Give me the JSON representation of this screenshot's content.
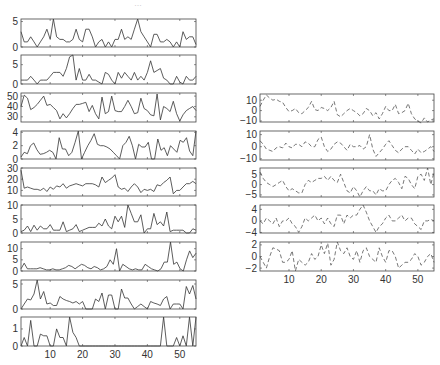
{
  "figure": {
    "top_mark": "…"
  },
  "chart_data": [
    {
      "type": "line",
      "group": "left",
      "panel": 1,
      "box": [
        21,
        19,
        196,
        47
      ],
      "xlim": [
        1,
        55
      ],
      "ylim": [
        0,
        5.5
      ],
      "yticks": [
        0,
        5
      ],
      "xticks": [],
      "grid": false,
      "values": [
        3,
        1,
        1,
        2,
        1,
        0,
        1,
        2,
        3.5,
        1.5,
        5.5,
        2,
        1.5,
        1.5,
        1,
        1,
        1.5,
        3.5,
        1.5,
        1,
        3.5,
        3.5,
        2,
        0,
        1,
        1.5,
        0,
        1,
        0,
        1.5,
        1.5,
        3.5,
        1.5,
        2,
        1.5,
        3.5,
        5.5,
        3,
        2,
        1,
        0,
        2.5,
        2.5,
        1,
        1,
        1.5,
        1,
        0,
        1,
        0,
        3,
        1.5,
        2,
        2,
        0.5
      ]
    },
    {
      "type": "line",
      "group": "left",
      "panel": 2,
      "box": [
        21,
        55,
        196,
        84
      ],
      "xlim": [
        1,
        55
      ],
      "ylim": [
        0,
        7.5
      ],
      "yticks": [
        0,
        5
      ],
      "xticks": [],
      "values": [
        1,
        1,
        1,
        2,
        1,
        0,
        1,
        1,
        1,
        2,
        3,
        3,
        3,
        2,
        4,
        7,
        7.5,
        1,
        4,
        1,
        1,
        2.5,
        1,
        1,
        0.5,
        0,
        3,
        2.5,
        1,
        0,
        3,
        1.5,
        3,
        2,
        1,
        3,
        1,
        2,
        1,
        3,
        6,
        3,
        3.5,
        4,
        1.5,
        1,
        0,
        0,
        2,
        0.5,
        0,
        2,
        1,
        1,
        2
      ]
    },
    {
      "type": "line",
      "group": "left",
      "panel": 3,
      "box": [
        21,
        93,
        196,
        122
      ],
      "xlim": [
        1,
        55
      ],
      "ylim": [
        25,
        53
      ],
      "yticks": [
        30,
        40,
        50
      ],
      "xticks": [],
      "values": [
        40,
        51,
        48,
        37,
        39,
        42,
        46,
        50,
        41,
        42,
        39,
        36,
        28,
        33,
        29,
        33,
        38,
        42,
        42,
        43,
        44,
        35,
        41,
        33,
        28,
        49,
        33,
        35,
        50,
        36,
        35,
        35,
        40,
        46,
        40,
        33,
        34,
        48,
        38,
        36,
        32,
        31,
        52,
        27,
        40,
        38,
        35,
        45,
        33,
        26,
        32,
        36,
        38,
        40,
        36
      ]
    },
    {
      "type": "line",
      "group": "left",
      "panel": 4,
      "box": [
        21,
        131,
        196,
        159
      ],
      "xlim": [
        1,
        55
      ],
      "ylim": [
        0,
        4.2
      ],
      "yticks": [
        0,
        2,
        4
      ],
      "xticks": [],
      "values": [
        0.3,
        1,
        0.8,
        2,
        2.4,
        1.4,
        0.7,
        0.8,
        1,
        1.3,
        1,
        0,
        3.2,
        1.5,
        1.5,
        0.5,
        1,
        2.5,
        4.2,
        0,
        1,
        2,
        2.8,
        3.8,
        2.2,
        2,
        2,
        1.8,
        1.5,
        1,
        0.5,
        0,
        2,
        2.5,
        3.4,
        2,
        0,
        2.2,
        1.8,
        1.8,
        2.5,
        0,
        0,
        3,
        1.3,
        1.7,
        0.5,
        2,
        1.5,
        1,
        2.8,
        2.5,
        3.2,
        1.2,
        0.5,
        4.2
      ]
    },
    {
      "type": "line",
      "group": "left",
      "panel": 5,
      "box": [
        21,
        168,
        196,
        196
      ],
      "xlim": [
        1,
        55
      ],
      "ylim": [
        5,
        30
      ],
      "yticks": [
        10,
        20,
        30
      ],
      "xticks": [],
      "values": [
        28,
        12,
        13,
        12,
        11,
        11,
        10,
        12,
        9,
        13,
        11,
        14,
        13,
        16,
        12,
        14,
        15,
        16,
        15,
        14,
        16,
        16,
        16,
        15,
        13,
        22,
        17,
        19,
        21,
        24,
        13,
        11,
        12,
        9,
        13,
        16,
        13,
        8,
        11,
        10,
        11,
        9,
        15,
        14,
        17,
        19,
        22,
        7,
        10,
        10,
        13,
        16,
        16,
        18,
        16
      ]
    },
    {
      "type": "line",
      "group": "left",
      "panel": 6,
      "box": [
        21,
        205,
        196,
        233
      ],
      "xlim": [
        1,
        55
      ],
      "ylim": [
        0,
        10
      ],
      "yticks": [
        0,
        5,
        10
      ],
      "xticks": [],
      "values": [
        0.5,
        1,
        2.5,
        0.5,
        2.8,
        1,
        2.5,
        1.5,
        1.5,
        3,
        1,
        1,
        1,
        4,
        0.5,
        1,
        1.5,
        3,
        0.5,
        1,
        1.5,
        2,
        2,
        2,
        3.5,
        2.5,
        5,
        2.5,
        1.5,
        6,
        4,
        6,
        2,
        10,
        7,
        4,
        4,
        6.5,
        0,
        1.5,
        1.5,
        7,
        3,
        4,
        2.5,
        7.5,
        0.5,
        1,
        1,
        1,
        1,
        0,
        0,
        1.5,
        1
      ]
    },
    {
      "type": "line",
      "group": "left",
      "panel": 7,
      "box": [
        21,
        242,
        196,
        271
      ],
      "xlim": [
        1,
        55
      ],
      "ylim": [
        0,
        13
      ],
      "yticks": [
        0,
        5,
        10
      ],
      "xticks": [],
      "values": [
        1,
        3.5,
        1,
        1,
        1,
        1,
        1.5,
        1,
        0.5,
        0.5,
        1,
        0.5,
        0.5,
        1,
        1.5,
        2.5,
        2,
        1,
        2,
        3,
        2.5,
        1.5,
        1,
        2,
        1.5,
        0.5,
        1,
        2,
        5,
        3,
        10,
        0,
        3,
        2,
        1,
        0.5,
        1,
        0.5,
        0.5,
        3,
        2,
        1,
        0.5,
        0,
        1,
        4,
        4,
        13,
        3,
        4,
        1,
        0,
        5,
        9,
        6,
        8
      ]
    },
    {
      "type": "line",
      "group": "left",
      "panel": 8,
      "box": [
        21,
        280,
        196,
        309
      ],
      "xlim": [
        1,
        55
      ],
      "ylim": [
        0,
        5.8
      ],
      "yticks": [
        0,
        5
      ],
      "xticks": [],
      "values": [
        0,
        1,
        2,
        1.8,
        3,
        5.8,
        2,
        3.5,
        1,
        1.2,
        0.7,
        0.7,
        2.5,
        2,
        1.7,
        1.5,
        1.2,
        1.5,
        1,
        1.5,
        0,
        0,
        0,
        2,
        1.5,
        3.2,
        0,
        2.8,
        2.8,
        0,
        0,
        4,
        2.2,
        2.2,
        1,
        0,
        0.5,
        1,
        0.5,
        0,
        1.5,
        1.2,
        1,
        0.7,
        2,
        2.5,
        0,
        1,
        1,
        1,
        0,
        4.5,
        3,
        4.7,
        2
      ]
    },
    {
      "type": "line",
      "group": "left",
      "panel": 9,
      "box": [
        21,
        317,
        196,
        346
      ],
      "xlim": [
        1,
        55
      ],
      "ylim": [
        0,
        1.7
      ],
      "yticks": [
        0,
        1
      ],
      "xticks": [
        10,
        20,
        30,
        40,
        50
      ],
      "values": [
        0,
        0.5,
        0,
        1.5,
        0,
        0,
        0.7,
        0.6,
        0.6,
        0,
        0,
        1,
        0.5,
        0.5,
        0,
        1.7,
        0.8,
        0.5,
        0,
        0,
        0,
        0,
        0,
        0,
        0,
        0,
        0,
        0,
        0,
        0,
        0,
        0,
        0,
        0,
        0,
        0,
        0,
        0,
        0,
        0,
        0,
        0,
        0,
        0,
        1.7,
        0,
        0,
        0,
        0.5,
        0,
        0.6,
        0,
        1.7,
        0,
        1.7
      ]
    },
    {
      "type": "line",
      "group": "right",
      "panel": 1,
      "box": [
        260,
        94,
        434,
        122
      ],
      "xlim": [
        1,
        55
      ],
      "ylim": [
        -11,
        16
      ],
      "yticks": [
        -10,
        0,
        10
      ],
      "xticks": [],
      "values": [
        4,
        10,
        15,
        12,
        10,
        11,
        9,
        8,
        3,
        -1,
        0,
        2,
        -2,
        -3,
        0,
        3,
        9,
        1,
        0,
        3,
        2,
        0,
        3,
        9,
        -4,
        -6,
        -3,
        0,
        2,
        0,
        -2,
        -5,
        -3,
        2,
        0,
        -5,
        -2,
        -8,
        -3,
        4,
        0,
        0,
        6,
        -3,
        -2,
        0,
        7,
        -3,
        -8,
        -10,
        -12,
        -7,
        -11,
        -9,
        -8
      ]
    },
    {
      "type": "line",
      "group": "right",
      "panel": 2,
      "box": [
        260,
        131,
        434,
        160
      ],
      "xlim": [
        1,
        55
      ],
      "ylim": [
        -11,
        13
      ],
      "yticks": [
        -10,
        0,
        10
      ],
      "xticks": [],
      "values": [
        5,
        2,
        -2,
        -3,
        -4,
        -1,
        0,
        -1,
        3,
        0,
        -1,
        2,
        2,
        0,
        4,
        3,
        0,
        0,
        6,
        8,
        0,
        -4,
        -2,
        2,
        4,
        3,
        0,
        -3,
        2,
        0,
        0,
        1,
        -2,
        0,
        10,
        -2,
        -8,
        -5,
        -2,
        2,
        5,
        1,
        -3,
        -5,
        -2,
        0,
        0,
        -3,
        -6,
        -2,
        -5,
        -4,
        -2,
        0,
        -4
      ]
    },
    {
      "type": "line",
      "group": "right",
      "panel": 3,
      "box": [
        260,
        168,
        434,
        197
      ],
      "xlim": [
        1,
        55
      ],
      "ylim": [
        -6,
        8
      ],
      "yticks": [
        -5,
        0,
        5
      ],
      "xticks": [],
      "values": [
        6,
        3,
        1,
        0,
        -1,
        0,
        1,
        2,
        -1,
        -3,
        -2,
        -3,
        -4,
        -4,
        0,
        2,
        1,
        2,
        3,
        3,
        4,
        2,
        4,
        2,
        1,
        5,
        1,
        -3,
        -4,
        -1,
        -3,
        -6,
        -3,
        -1,
        -3,
        -3,
        -5,
        -2,
        -3,
        -3,
        0,
        2,
        3,
        1,
        -2,
        4,
        3,
        0,
        -2,
        4,
        5,
        2,
        8,
        0,
        6
      ]
    },
    {
      "type": "line",
      "group": "right",
      "panel": 4,
      "box": [
        260,
        205,
        434,
        233
      ],
      "xlim": [
        1,
        55
      ],
      "ylim": [
        -4.2,
        5.5
      ],
      "yticks": [
        -4,
        0,
        4
      ],
      "xticks": [],
      "values": [
        0,
        -1,
        1,
        0,
        -1,
        1,
        -2,
        0,
        0,
        1,
        -1,
        -2,
        -4,
        -2,
        1,
        0,
        1,
        2,
        0,
        1,
        -1,
        1,
        -1,
        -2,
        2,
        2,
        -1,
        2,
        1,
        2,
        2,
        4,
        5.5,
        3,
        0,
        -2,
        -4,
        -2,
        -1,
        1,
        2,
        0,
        0,
        1,
        2,
        0,
        1,
        1,
        -1,
        -2,
        -3,
        0,
        0,
        0.5,
        0
      ]
    },
    {
      "type": "line",
      "group": "right",
      "panel": 5,
      "box": [
        260,
        242,
        434,
        271
      ],
      "xlim": [
        1,
        55
      ],
      "ylim": [
        -2.5,
        2.5
      ],
      "yticks": [
        -2,
        0,
        2
      ],
      "xticks": [
        10,
        20,
        30,
        40,
        50
      ],
      "values": [
        0,
        -1,
        -2,
        0,
        1.5,
        1.3,
        1,
        -1,
        -1,
        -0.5,
        1,
        -2.5,
        -0.5,
        -1,
        -1.5,
        -1,
        0.5,
        -0.5,
        0,
        2,
        0.5,
        2.3,
        -1.5,
        -0.5,
        2.5,
        1,
        0.5,
        1.5,
        0,
        -0.5,
        1,
        -1,
        1,
        1.5,
        0,
        -0.5,
        -1,
        1.5,
        0,
        -1,
        1,
        1,
        0,
        -2,
        -1.5,
        -1,
        -1,
        -0.5,
        0.5,
        0,
        -1.5,
        -1,
        0,
        0.5,
        -1
      ]
    }
  ]
}
